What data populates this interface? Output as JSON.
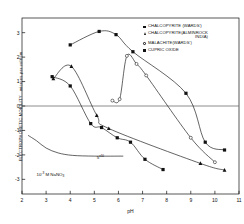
{
  "figure": {
    "background": "#ffffff",
    "ink": "#111111"
  },
  "chart_data": {
    "type": "line",
    "title": "",
    "xlabel": "pH",
    "ylabel": "ELECTROPHORETIC MOBILITY microns per volt/cm",
    "xlim": [
      2,
      11
    ],
    "ylim": [
      -3.6,
      3.6
    ],
    "xticks": [
      2,
      3,
      4,
      5,
      6,
      7,
      8,
      9,
      10,
      11
    ],
    "yticks": [
      3,
      2,
      1,
      0,
      -1,
      -2,
      -3
    ],
    "xticklabels": [
      "2",
      "3",
      "4",
      "5",
      "6",
      "7",
      "8",
      "9",
      "10",
      "11"
    ],
    "yticklabels": [
      "3",
      "2",
      "1",
      "0",
      "-1",
      "-2",
      "-3"
    ],
    "grid": false,
    "zero_line": true,
    "legend_position": "upper-right",
    "annotations": [
      {
        "text": "10",
        "sup": "-3",
        "rest": " M NaNO",
        "sub": "3",
        "x": 2.6,
        "y": -2.85
      },
      {
        "text": "5",
        "sup": "x10",
        "x": 5.1,
        "y": -2.18
      }
    ],
    "series": [
      {
        "name": "CUPRIC OXIDE",
        "marker": "filled-square",
        "points": [
          {
            "x": 4.0,
            "y": 2.5
          },
          {
            "x": 5.2,
            "y": 3.05
          },
          {
            "x": 5.9,
            "y": 2.92
          },
          {
            "x": 6.6,
            "y": 2.22
          },
          {
            "x": 8.8,
            "y": 0.52
          },
          {
            "x": 9.6,
            "y": -1.48
          },
          {
            "x": 10.4,
            "y": -1.8
          }
        ]
      },
      {
        "name": "CHALCOPYRITE (WARDS')",
        "marker": "filled-square",
        "points": [
          {
            "x": 3.25,
            "y": 1.2
          },
          {
            "x": 4.0,
            "y": 0.82
          },
          {
            "x": 4.85,
            "y": -0.72
          },
          {
            "x": 5.3,
            "y": -0.88
          },
          {
            "x": 5.95,
            "y": -1.3
          },
          {
            "x": 6.5,
            "y": -1.48
          },
          {
            "x": 7.1,
            "y": -2.18
          },
          {
            "x": 7.85,
            "y": -2.6
          }
        ]
      },
      {
        "name": "CHALCOPYRITE (ALMINROCK INDIA)",
        "marker": "filled-triangle",
        "points": [
          {
            "x": 3.3,
            "y": 1.12
          },
          {
            "x": 4.05,
            "y": 1.62
          },
          {
            "x": 5.1,
            "y": -0.38
          },
          {
            "x": 5.6,
            "y": -0.92
          },
          {
            "x": 9.4,
            "y": -2.35
          },
          {
            "x": 10.4,
            "y": -2.62
          }
        ]
      },
      {
        "name": "MALACHITE (WARDS')",
        "marker": "open-circle",
        "points": [
          {
            "x": 5.75,
            "y": 0.22
          },
          {
            "x": 6.05,
            "y": 0.28
          },
          {
            "x": 6.35,
            "y": 2.05
          },
          {
            "x": 6.75,
            "y": 1.72
          },
          {
            "x": 7.15,
            "y": 1.25
          },
          {
            "x": 9.0,
            "y": -1.3
          },
          {
            "x": 10.0,
            "y": -2.3
          }
        ]
      },
      {
        "name": "NaNO3 electrolyte",
        "marker": "none",
        "points": [
          {
            "x": 2.25,
            "y": -1.2
          },
          {
            "x": 2.6,
            "y": -1.42
          },
          {
            "x": 3.0,
            "y": -1.72
          },
          {
            "x": 3.5,
            "y": -1.92
          },
          {
            "x": 4.1,
            "y": -2.02
          },
          {
            "x": 5.0,
            "y": -2.05
          },
          {
            "x": 6.2,
            "y": -2.05
          }
        ]
      }
    ]
  },
  "legend": {
    "items": [
      {
        "marker": "filled-square",
        "label": "CHALCOPYRITE (WARDS')",
        "indent": ""
      },
      {
        "marker": "filled-triangle",
        "label": "CHALCOPYRITE(ALMINROCK",
        "indent": "INDIA)"
      },
      {
        "marker": "open-circle",
        "label": "MALACHITE(WARDS')",
        "indent": ""
      },
      {
        "marker": "filled-square",
        "label": "CUPRIC OXIDE",
        "indent": ""
      }
    ]
  },
  "axes": {
    "x_label": "pH",
    "y_label_main": "ELECTROPHORETIC  MOBILITY",
    "y_label_unit": "microns per volt/cm"
  }
}
